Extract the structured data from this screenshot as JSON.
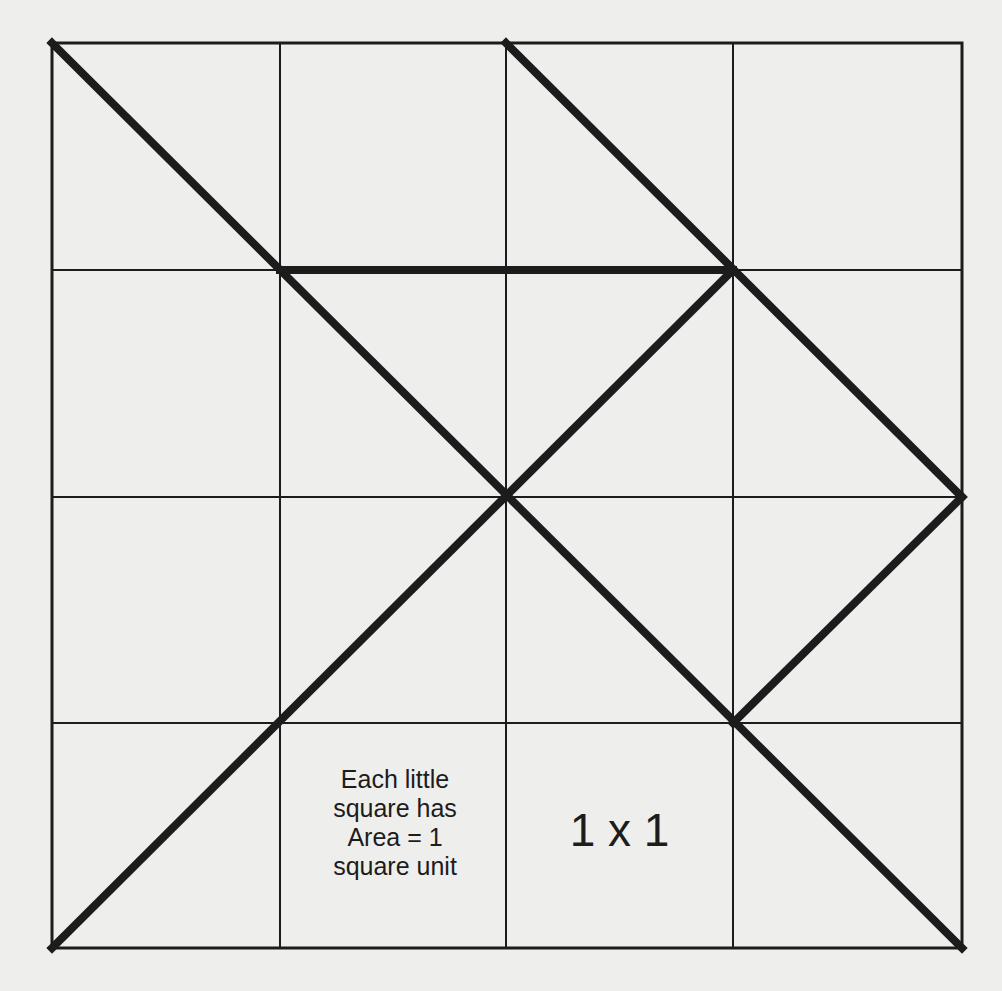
{
  "diagram": {
    "grid": {
      "rows": 4,
      "cols": 4,
      "origin": [
        52,
        43
      ],
      "size": [
        910,
        905
      ],
      "cell_area_units": 1
    },
    "thick_segments": [
      {
        "from": [
          0,
          0
        ],
        "to": [
          4,
          4
        ]
      },
      {
        "from": [
          0,
          4
        ],
        "to": [
          3,
          1
        ]
      },
      {
        "from": [
          1,
          1
        ],
        "to": [
          3,
          1
        ]
      },
      {
        "from": [
          2,
          0
        ],
        "to": [
          4,
          2
        ]
      },
      {
        "from": [
          3,
          3
        ],
        "to": [
          4,
          2
        ]
      }
    ],
    "colors": {
      "background": "#eeeeec",
      "line": "#1c1c1c"
    }
  },
  "labels": {
    "cell_note_line1": "Each little",
    "cell_note_line2": "square has",
    "cell_note_line3": "Area = 1",
    "cell_note_line4": "square unit",
    "unit_size": "1 x 1"
  }
}
